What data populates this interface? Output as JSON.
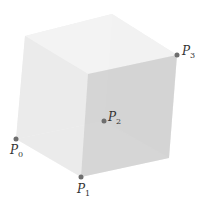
{
  "diagram": {
    "points": [
      {
        "label": "P",
        "sub": "0",
        "x": 16,
        "y": 139
      },
      {
        "label": "P",
        "sub": "1",
        "x": 81,
        "y": 177
      },
      {
        "label": "P",
        "sub": "2",
        "x": 104,
        "y": 121
      },
      {
        "label": "P",
        "sub": "3",
        "x": 177,
        "y": 55
      }
    ],
    "colors": {
      "point": "#6e6e6e",
      "face_light": "#ececec",
      "face_mid": "#e2e2e2",
      "face_dark": "#cfcfcf",
      "label": "#333333"
    }
  }
}
